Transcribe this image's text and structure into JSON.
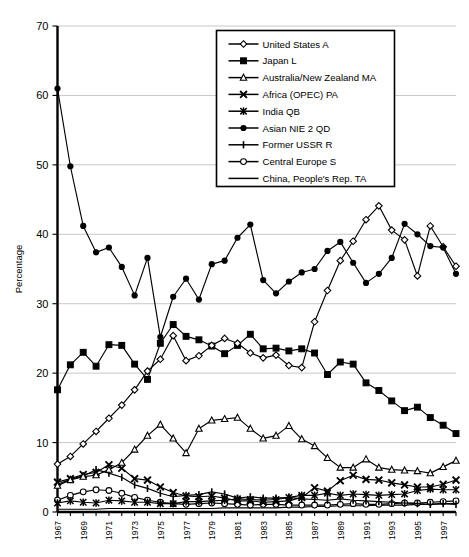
{
  "chart_data": {
    "type": "line",
    "title": "",
    "xlabel": "",
    "ylabel": "Percentage",
    "ylim": [
      0,
      70
    ],
    "ytick_step": 10,
    "yticks": [
      "0",
      "10",
      "20",
      "30",
      "40",
      "50",
      "60",
      "70"
    ],
    "grid": true,
    "legend_position": "top-right",
    "x": [
      1967,
      1968,
      1969,
      1970,
      1971,
      1972,
      1973,
      1974,
      1975,
      1976,
      1977,
      1978,
      1979,
      1980,
      1981,
      1982,
      1983,
      1984,
      1985,
      1986,
      1987,
      1988,
      1989,
      1990,
      1991,
      1992,
      1993,
      1994,
      1995,
      1996,
      1997,
      1998
    ],
    "xtick_labels": [
      "1967",
      "1969",
      "1971",
      "1973",
      "1975",
      "1977",
      "1979",
      "1981",
      "1983",
      "1985",
      "1987",
      "1989",
      "1991",
      "1993",
      "1995",
      "1997"
    ],
    "series": [
      {
        "name": "United States A",
        "marker": "open-diamond",
        "values": [
          6.9,
          8.0,
          9.8,
          11.6,
          13.5,
          15.4,
          17.6,
          20.3,
          22.0,
          25.4,
          21.8,
          22.5,
          24.0,
          25.0,
          24.3,
          22.9,
          22.2,
          22.6,
          21.1,
          20.8,
          27.4,
          31.9,
          36.2,
          39.0,
          42.1,
          44.1,
          40.6,
          39.2,
          34.0,
          41.2,
          38.2,
          35.4
        ]
      },
      {
        "name": "Japan L",
        "marker": "filled-square",
        "values": [
          17.6,
          21.2,
          23.0,
          21.0,
          24.1,
          24.0,
          21.3,
          19.1,
          24.3,
          27.0,
          25.3,
          24.8,
          23.9,
          22.8,
          24.0,
          25.6,
          23.5,
          23.6,
          23.2,
          23.5,
          22.9,
          19.8,
          21.6,
          21.3,
          18.6,
          17.5,
          16.0,
          14.6,
          15.1,
          13.6,
          12.5,
          11.3
        ]
      },
      {
        "name": "Australia/New Zealand MA",
        "marker": "open-triangle",
        "values": [
          3.8,
          4.6,
          5.1,
          5.3,
          6.1,
          7.1,
          9.0,
          11.0,
          12.6,
          10.6,
          8.5,
          12.0,
          13.2,
          13.4,
          13.6,
          12.0,
          10.6,
          11.0,
          12.4,
          10.5,
          9.5,
          7.8,
          6.4,
          6.4,
          7.6,
          6.4,
          6.1,
          6.0,
          5.9,
          5.6,
          6.5,
          7.4
        ]
      },
      {
        "name": "Africa (OPEC) PA",
        "marker": "cross-x",
        "values": [
          4.3,
          4.8,
          5.4,
          5.7,
          6.8,
          6.3,
          4.8,
          4.6,
          3.6,
          2.8,
          2.3,
          2.2,
          2.3,
          2.0,
          1.6,
          1.6,
          1.4,
          1.5,
          1.6,
          2.1,
          3.5,
          3.0,
          4.5,
          5.3,
          4.7,
          4.6,
          4.2,
          3.9,
          3.6,
          3.6,
          4.0,
          4.6
        ]
      },
      {
        "name": "India QB",
        "marker": "star-x",
        "values": [
          1.3,
          1.6,
          1.4,
          1.3,
          1.7,
          1.6,
          1.4,
          1.4,
          1.2,
          1.2,
          1.5,
          1.5,
          1.6,
          1.7,
          1.9,
          1.8,
          1.7,
          1.8,
          2.1,
          2.4,
          2.4,
          2.7,
          2.4,
          2.6,
          2.5,
          2.4,
          2.5,
          2.6,
          3.1,
          3.3,
          3.2,
          3.2
        ]
      },
      {
        "name": "Asian NIE 2 QD",
        "marker": "filled-circle",
        "values": [
          61.0,
          49.8,
          41.2,
          37.4,
          38.1,
          35.3,
          31.2,
          36.6,
          25.2,
          31.0,
          33.6,
          30.6,
          35.7,
          36.2,
          39.5,
          41.4,
          33.4,
          31.5,
          33.2,
          34.5,
          35.0,
          37.6,
          38.9,
          35.9,
          33.0,
          34.3,
          36.6,
          41.5,
          40.0,
          38.3,
          38.1,
          34.3
        ]
      },
      {
        "name": "Former USSR R",
        "marker": "plus",
        "values": [
          4.0,
          4.7,
          5.2,
          6.1,
          5.6,
          5.0,
          3.9,
          3.4,
          2.7,
          2.2,
          2.4,
          2.5,
          2.9,
          2.6,
          2.0,
          2.2,
          2.0,
          2.0,
          2.1,
          1.9,
          1.8,
          1.7,
          1.9,
          1.7,
          1.6,
          1.5,
          1.4,
          1.3,
          1.2,
          1.1,
          1.2,
          1.1
        ]
      },
      {
        "name": "Central Europe S",
        "marker": "open-circle",
        "values": [
          1.7,
          2.4,
          2.9,
          3.2,
          3.1,
          2.7,
          2.1,
          1.7,
          1.4,
          1.2,
          1.1,
          1.2,
          1.3,
          1.2,
          1.1,
          1.0,
          1.1,
          1.1,
          1.0,
          1.0,
          1.0,
          1.0,
          1.1,
          1.2,
          1.1,
          1.1,
          1.2,
          1.3,
          1.3,
          1.4,
          1.5,
          1.6
        ]
      },
      {
        "name": "China, People's Rep. TA",
        "marker": "none",
        "values": [
          0.4,
          0.4,
          0.4,
          0.4,
          0.5,
          0.5,
          0.5,
          0.5,
          0.5,
          0.5,
          0.5,
          0.5,
          0.5,
          0.6,
          0.6,
          0.6,
          0.6,
          0.6,
          0.7,
          0.7,
          0.8,
          0.8,
          0.9,
          0.9,
          0.9,
          1.0,
          1.0,
          1.0,
          1.1,
          1.1,
          1.2,
          1.2
        ]
      }
    ]
  }
}
